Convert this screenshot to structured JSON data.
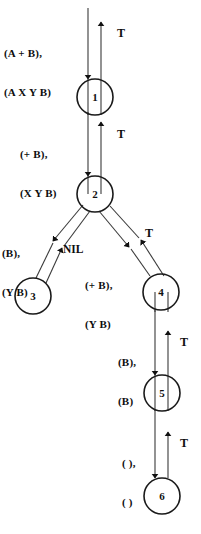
{
  "diagram": {
    "type": "recursive-descent-parse-trace-tree",
    "title": "",
    "colors": {
      "stroke": "#3a3a3a",
      "node_stroke": "#1a1a1a",
      "text": "#0d0d0d",
      "background": "#ffffff",
      "arrowhead": "#111111"
    },
    "nodes": [
      {
        "id": "n1",
        "label": "1",
        "cx": 95,
        "cy": 97,
        "r": 18
      },
      {
        "id": "n2",
        "label": "2",
        "cx": 95,
        "cy": 194,
        "r": 18
      },
      {
        "id": "n3",
        "label": "3",
        "cx": 33,
        "cy": 296,
        "r": 18
      },
      {
        "id": "n4",
        "label": "4",
        "cx": 161,
        "cy": 292,
        "r": 18
      },
      {
        "id": "n5",
        "label": "5",
        "cx": 162,
        "cy": 393,
        "r": 18
      },
      {
        "id": "n6",
        "label": "6",
        "cx": 162,
        "cy": 496,
        "r": 18
      }
    ],
    "edge_labels": [
      {
        "id": "e-top-in",
        "line1": "(A + B),",
        "line2": "(A X Y B)",
        "x": 4,
        "y": 21,
        "align": "left"
      },
      {
        "id": "e-1-2-in",
        "line1": "(+ B),",
        "line2": "(X Y B)",
        "x": 20,
        "y": 122,
        "align": "left"
      },
      {
        "id": "e-2-3-in",
        "line1": "(B),",
        "line2": "(Y B)",
        "x": 2,
        "y": 221,
        "align": "left"
      },
      {
        "id": "e-2-4-in",
        "line1": "(+ B),",
        "line2": "(Y B)",
        "x": 85,
        "y": 253,
        "align": "left"
      },
      {
        "id": "e-4-5-in",
        "line1": "(B),",
        "line2": "(B)",
        "x": 118,
        "y": 330,
        "align": "left"
      },
      {
        "id": "e-5-6-in",
        "line1": "( ),",
        "line2": "( )",
        "x": 122,
        "y": 431,
        "align": "left"
      }
    ],
    "return_labels": [
      {
        "id": "t-top",
        "text": "T",
        "x": 117,
        "y": 26
      },
      {
        "id": "t-1-2",
        "text": "T",
        "x": 117,
        "y": 127
      },
      {
        "id": "t-2-4",
        "text": "T",
        "x": 145,
        "y": 226
      },
      {
        "id": "t-4-5",
        "text": "T",
        "x": 180,
        "y": 335
      },
      {
        "id": "t-5-6",
        "text": "T",
        "x": 180,
        "y": 436
      }
    ],
    "nil_label": {
      "id": "nil-2-3",
      "text": "NIL",
      "x": 63,
      "y": 243
    },
    "edges": [
      {
        "id": "edge-root-1-down",
        "from": "root",
        "to": "n1",
        "direction": "down",
        "kind": "call",
        "label_ref": "e-top-in"
      },
      {
        "id": "edge-1-root-up",
        "from": "n1",
        "to": "root",
        "direction": "up",
        "kind": "return",
        "label_ref": "t-top"
      },
      {
        "id": "edge-1-2-down",
        "from": "n1",
        "to": "n2",
        "direction": "down",
        "kind": "call",
        "label_ref": "e-1-2-in"
      },
      {
        "id": "edge-2-1-up",
        "from": "n2",
        "to": "n1",
        "direction": "up",
        "kind": "return",
        "label_ref": "t-1-2"
      },
      {
        "id": "edge-2-3-down",
        "from": "n2",
        "to": "n3",
        "direction": "down",
        "kind": "call",
        "label_ref": "e-2-3-in"
      },
      {
        "id": "edge-3-2-up",
        "from": "n3",
        "to": "n2",
        "direction": "up",
        "kind": "return",
        "label_ref": "nil-2-3"
      },
      {
        "id": "edge-2-4-down",
        "from": "n2",
        "to": "n4",
        "direction": "down",
        "kind": "call",
        "label_ref": "e-2-4-in"
      },
      {
        "id": "edge-4-2-up",
        "from": "n4",
        "to": "n2",
        "direction": "up",
        "kind": "return",
        "label_ref": "t-2-4"
      },
      {
        "id": "edge-4-5-down",
        "from": "n4",
        "to": "n5",
        "direction": "down",
        "kind": "call",
        "label_ref": "e-4-5-in"
      },
      {
        "id": "edge-5-4-up",
        "from": "n5",
        "to": "n4",
        "direction": "up",
        "kind": "return",
        "label_ref": "t-4-5"
      },
      {
        "id": "edge-5-6-down",
        "from": "n5",
        "to": "n6",
        "direction": "down",
        "kind": "call",
        "label_ref": "e-5-6-in"
      },
      {
        "id": "edge-6-5-up",
        "from": "n6",
        "to": "n5",
        "direction": "up",
        "kind": "return",
        "label_ref": "t-5-6"
      }
    ]
  }
}
